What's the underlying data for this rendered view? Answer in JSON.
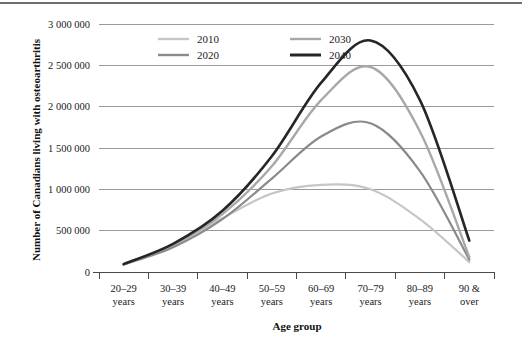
{
  "chart_data": {
    "type": "line",
    "title": "",
    "xlabel": "Age group",
    "ylabel": "Number of Canadians living with osteoarthritis",
    "categories": [
      "20–29 years",
      "30–39 years",
      "40–49 years",
      "50–59 years",
      "60–69 years",
      "70–79 years",
      "80–89 years",
      "90 & over"
    ],
    "category_lines": [
      [
        "20–29",
        "years"
      ],
      [
        "30–39",
        "years"
      ],
      [
        "40–49",
        "years"
      ],
      [
        "50–59",
        "years"
      ],
      [
        "60–69",
        "years"
      ],
      [
        "70–79",
        "years"
      ],
      [
        "80–89",
        "years"
      ],
      [
        "90 &",
        "over"
      ]
    ],
    "ylim": [
      0,
      3000000
    ],
    "ytick_values": [
      0,
      500000,
      1000000,
      1500000,
      2000000,
      2500000,
      3000000
    ],
    "ytick_labels": [
      "0",
      "500 000",
      "1 000 000",
      "1 500 000",
      "2 000 000",
      "2 500 000",
      "3 000 000"
    ],
    "grid": true,
    "legend_position": "top-inside",
    "series": [
      {
        "name": "2010",
        "color": "#c6c6c6",
        "width": 2.2,
        "values": [
          90000,
          320000,
          650000,
          950000,
          1055000,
          1000000,
          640000,
          120000
        ]
      },
      {
        "name": "2020",
        "color": "#8a8a8a",
        "width": 2.2,
        "values": [
          90000,
          300000,
          640000,
          1130000,
          1640000,
          1800000,
          1220000,
          150000
        ]
      },
      {
        "name": "2030",
        "color": "#a8a8a8",
        "width": 2.4,
        "values": [
          95000,
          330000,
          700000,
          1280000,
          2080000,
          2480000,
          1700000,
          180000
        ]
      },
      {
        "name": "2040",
        "color": "#262626",
        "width": 2.6,
        "values": [
          95000,
          340000,
          740000,
          1400000,
          2290000,
          2800000,
          2080000,
          380000
        ]
      }
    ],
    "legend": [
      {
        "label": "2010",
        "color": "#c6c6c6"
      },
      {
        "label": "2030",
        "color": "#a8a8a8"
      },
      {
        "label": "2020",
        "color": "#8a8a8a"
      },
      {
        "label": "2040",
        "color": "#262626"
      }
    ]
  }
}
